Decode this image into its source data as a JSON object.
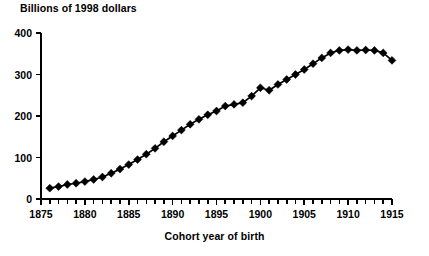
{
  "chart_data": {
    "type": "line",
    "title": "Billions of 1998 dollars",
    "xlabel": "Cohort year of birth",
    "ylabel": "Billions of 1998 dollars",
    "grid": false,
    "legend": "none",
    "marker": "diamond",
    "xlim": [
      1875,
      1915
    ],
    "ylim": [
      0,
      400
    ],
    "x_ticks_major": [
      1875,
      1880,
      1885,
      1890,
      1895,
      1900,
      1905,
      1910,
      1915
    ],
    "x_tick_labels": [
      "1875",
      "1880",
      "1885",
      "1890",
      "1895",
      "1900",
      "1905",
      "1910",
      "1915"
    ],
    "x_tick_minor_step": 1,
    "y_ticks": [
      0,
      100,
      200,
      300,
      400
    ],
    "y_tick_labels": [
      "0",
      "100",
      "200",
      "300",
      "400"
    ],
    "x": [
      1876,
      1877,
      1878,
      1879,
      1880,
      1881,
      1882,
      1883,
      1884,
      1885,
      1886,
      1887,
      1888,
      1889,
      1890,
      1891,
      1892,
      1893,
      1894,
      1895,
      1896,
      1897,
      1898,
      1899,
      1900,
      1901,
      1902,
      1903,
      1904,
      1905,
      1906,
      1907,
      1908,
      1909,
      1910,
      1911,
      1912,
      1913,
      1914,
      1915
    ],
    "values": [
      26,
      30,
      35,
      38,
      42,
      47,
      53,
      62,
      72,
      83,
      95,
      108,
      122,
      138,
      152,
      166,
      180,
      192,
      203,
      212,
      224,
      228,
      232,
      248,
      268,
      262,
      276,
      288,
      300,
      312,
      326,
      340,
      352,
      358,
      360,
      358,
      359,
      358,
      352,
      334
    ],
    "series": [
      {
        "name": "Billions of 1998 dollars",
        "values": [
          26,
          30,
          35,
          38,
          42,
          47,
          53,
          62,
          72,
          83,
          95,
          108,
          122,
          138,
          152,
          166,
          180,
          192,
          203,
          212,
          224,
          228,
          232,
          248,
          268,
          262,
          276,
          288,
          300,
          312,
          326,
          340,
          352,
          358,
          360,
          358,
          359,
          358,
          352,
          334
        ]
      }
    ],
    "line_color": "#000000",
    "marker_color": "#000000",
    "axis_color": "#000000"
  }
}
